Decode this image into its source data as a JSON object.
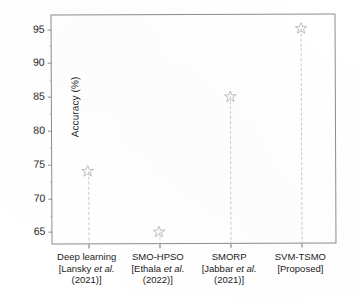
{
  "chart_data": {
    "type": "scatter",
    "title": "",
    "subtitle": "",
    "xlabel": "",
    "ylabel": "Accuracy (%)",
    "ylim": [
      63,
      97
    ],
    "yticks": [
      65,
      70,
      75,
      80,
      85,
      90,
      95
    ],
    "ytick_labels": [
      "65",
      "70",
      "75",
      "80",
      "85",
      "90",
      "95"
    ],
    "grid": false,
    "legend": "none",
    "marker": "star-outline",
    "marker_color": "#9a9a9a",
    "stem_style": "dashed",
    "stem_color": "#c9c9c9",
    "categories": [
      "Deep learning [Lansky et al. (2021)]",
      "SMO-HPSO [Ethala et al. (2022)]",
      "SMORP [Jabbar et al. (2021)]",
      "SVM-TSMO [Proposed]"
    ],
    "values": [
      74,
      65,
      85,
      95
    ],
    "points": [
      {
        "method": "Deep learning",
        "citation_author": "Lansky et al.",
        "citation_year": "(2021)",
        "label_line1": "Deep learning",
        "label_line2_pre": "[Lansky ",
        "label_line2_it": "et al.",
        "label_line3": "(2021)]",
        "value": 74
      },
      {
        "method": "SMO-HPSO",
        "citation_author": "Ethala et al.",
        "citation_year": "(2022)",
        "label_line1": "SMO-HPSO",
        "label_line2_pre": "[Ethala ",
        "label_line2_it": "et al.",
        "label_line3": "(2022)]",
        "value": 65
      },
      {
        "method": "SMORP",
        "citation_author": "Jabbar et al.",
        "citation_year": "(2021)",
        "label_line1": "SMORP",
        "label_line2_pre": "[Jabbar ",
        "label_line2_it": "et al.",
        "label_line3": "(2021)]",
        "value": 85
      },
      {
        "method": "SVM-TSMO",
        "citation_author": "Proposed",
        "citation_year": "",
        "label_line1": "SVM-TSMO",
        "label_line2_pre": "[Proposed]",
        "label_line2_it": "",
        "label_line3": "",
        "value": 95
      }
    ]
  }
}
